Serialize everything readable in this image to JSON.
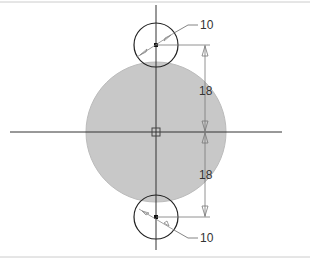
{
  "drawing": {
    "type": "technical-sketch",
    "colors": {
      "fill": "#c8c8c8",
      "stroke": "#222222",
      "dim": "#555555",
      "frame": "#cccccc"
    },
    "main_circle": {
      "cx": 156,
      "cy": 132,
      "r": 70
    },
    "small_circles": [
      {
        "cx": 156,
        "cy": 45,
        "r": 22,
        "diameter_label": "10"
      },
      {
        "cx": 156,
        "cy": 217,
        "r": 22,
        "diameter_label": "10"
      }
    ],
    "vertical_dimensions": [
      {
        "label": "18",
        "from_y": 45,
        "to_y": 132
      },
      {
        "label": "18",
        "from_y": 132,
        "to_y": 217
      }
    ]
  }
}
